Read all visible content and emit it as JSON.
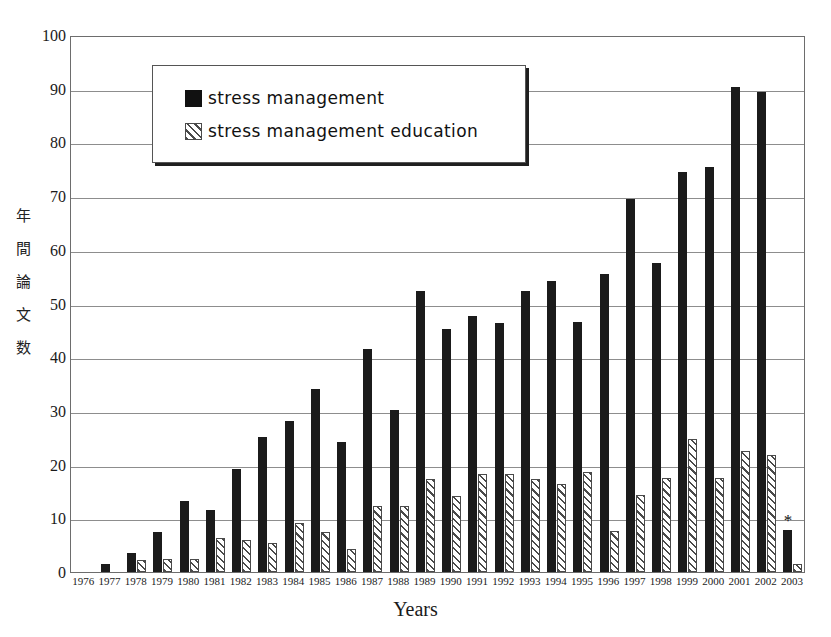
{
  "chart_data": {
    "type": "bar",
    "title": "",
    "xlabel": "Years",
    "ylabel": "年間論文数",
    "ylabel_chars": [
      "年",
      "間",
      "論",
      "文",
      "数"
    ],
    "ylim": [
      0,
      100
    ],
    "yticks": [
      0,
      10,
      20,
      30,
      40,
      50,
      60,
      70,
      80,
      90,
      100
    ],
    "grid": true,
    "legend_position": "top-left-inside",
    "categories": [
      "1976",
      "1977",
      "1978",
      "1979",
      "1980",
      "1981",
      "1982",
      "1983",
      "1984",
      "1985",
      "1986",
      "1987",
      "1988",
      "1989",
      "1990",
      "1991",
      "1992",
      "1993",
      "1994",
      "1995",
      "1996",
      "1997",
      "1998",
      "1999",
      "2000",
      "2001",
      "2002",
      "2003"
    ],
    "series": [
      {
        "name": "stress management",
        "pattern": "solid",
        "color": "#1b1b1b",
        "values": [
          0,
          1.5,
          3.5,
          7.5,
          13.2,
          11.5,
          19.2,
          25.2,
          28.2,
          34.0,
          24.3,
          41.5,
          30.2,
          52.3,
          45.3,
          47.6,
          46.3,
          52.4,
          54.2,
          46.5,
          55.5,
          69.4,
          57.5,
          74.5,
          75.5,
          90.3,
          89.3,
          7.8
        ]
      },
      {
        "name": "stress management education",
        "pattern": "diagonal-hatch",
        "color": "#ffffff",
        "values": [
          0,
          0,
          2.2,
          2.4,
          2.4,
          6.4,
          6.0,
          5.4,
          9.2,
          7.4,
          4.3,
          12.3,
          12.3,
          17.4,
          14.2,
          18.2,
          18.2,
          17.3,
          16.4,
          18.6,
          7.6,
          14.3,
          17.6,
          24.7,
          17.5,
          22.6,
          21.7,
          1.5
        ]
      }
    ],
    "annotations": [
      {
        "category": "2003",
        "marker": "*",
        "series": "stress management"
      }
    ]
  },
  "legend": {
    "items": [
      {
        "label": "stress management",
        "swatch": "solid-black"
      },
      {
        "label": "stress management education",
        "swatch": "diagonal-hatch"
      }
    ]
  }
}
